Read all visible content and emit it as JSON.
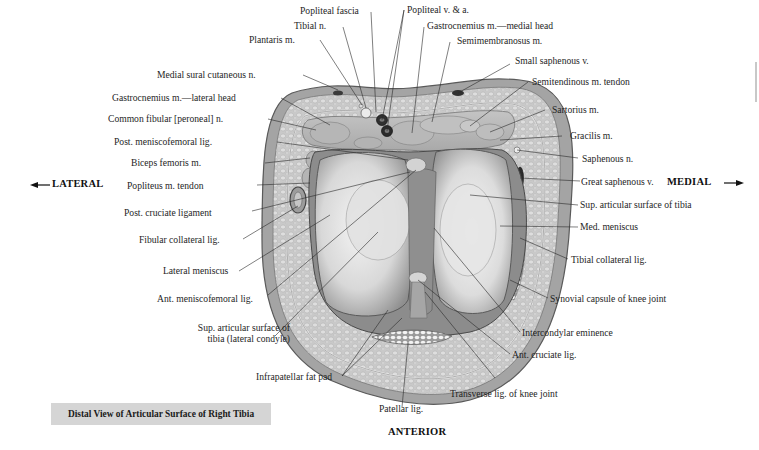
{
  "figure": {
    "caption": "Distal View of Articular Surface of Right Tibia",
    "orientation": {
      "lateral": "LATERAL",
      "medial": "MEDIAL",
      "anterior": "ANTERIOR",
      "lateral_arrow": "←",
      "medial_arrow": "→"
    },
    "labels_left": [
      {
        "id": "popliteal-fascia",
        "text": "Popliteal fascia"
      },
      {
        "id": "tibial-n",
        "text": "Tibial n."
      },
      {
        "id": "plantaris-m",
        "text": "Plantaris m."
      },
      {
        "id": "medial-sural-cutaneous-n",
        "text": "Medial sural cutaneous n."
      },
      {
        "id": "gastrocnemius-lateral-head",
        "text": "Gastrocnemius m.—lateral head"
      },
      {
        "id": "common-fibular-n",
        "text": "Common fibular [peroneal] n."
      },
      {
        "id": "post-meniscofemoral-lig",
        "text": "Post. meniscofemoral lig."
      },
      {
        "id": "biceps-femoris-m",
        "text": "Biceps femoris m."
      },
      {
        "id": "popliteus-m-tendon",
        "text": "Popliteus m. tendon"
      },
      {
        "id": "post-cruciate-ligament",
        "text": "Post. cruciate ligament"
      },
      {
        "id": "fibular-collateral-lig",
        "text": "Fibular collateral lig."
      },
      {
        "id": "lateral-meniscus",
        "text": "Lateral meniscus"
      },
      {
        "id": "ant-meniscofemoral-lig",
        "text": "Ant. meniscofemoral lig."
      },
      {
        "id": "sup-articular-lateral-1",
        "text": "Sup. articular surface of"
      },
      {
        "id": "sup-articular-lateral-2",
        "text": "tibia (lateral condyle)"
      },
      {
        "id": "infrapatellar-fat-pad",
        "text": "Infrapatellar fat pad"
      },
      {
        "id": "patellar-lig",
        "text": "Patellar lig."
      }
    ],
    "labels_right": [
      {
        "id": "popliteal-v-a",
        "text": "Popliteal v. & a."
      },
      {
        "id": "gastrocnemius-medial-head",
        "text": "Gastrocnemius m.—medial head"
      },
      {
        "id": "semimembranosus-m",
        "text": "Semimembranosus m."
      },
      {
        "id": "small-saphenous-v",
        "text": "Small saphenous v."
      },
      {
        "id": "semitendinous-m-tendon",
        "text": "Semitendinous m. tendon"
      },
      {
        "id": "sartorius-m",
        "text": "Sartorius m."
      },
      {
        "id": "gracilis-m",
        "text": "Gracilis m."
      },
      {
        "id": "saphenous-n",
        "text": "Saphenous n."
      },
      {
        "id": "great-saphenous-v",
        "text": "Great saphenous v."
      },
      {
        "id": "sup-articular-surface-tibia",
        "text": "Sup. articular surface of tibia"
      },
      {
        "id": "med-meniscus",
        "text": "Med. meniscus"
      },
      {
        "id": "tibial-collateral-lig",
        "text": "Tibial collateral lig."
      },
      {
        "id": "synovial-capsule",
        "text": "Synovial capsule of knee joint"
      },
      {
        "id": "intercondylar-eminence",
        "text": "Intercondylar eminence"
      },
      {
        "id": "ant-cruciate-lig",
        "text": "Ant. cruciate lig."
      },
      {
        "id": "transverse-lig",
        "text": "Transverse lig. of knee joint"
      }
    ],
    "colors": {
      "skin": "#a9a9a9",
      "fat": "#cfcfcf",
      "muscle": "#bcbcbc",
      "cartilage": "#e6e6e6",
      "dark": "#3a3a3a",
      "caption_bg": "#d5d5d5"
    }
  }
}
